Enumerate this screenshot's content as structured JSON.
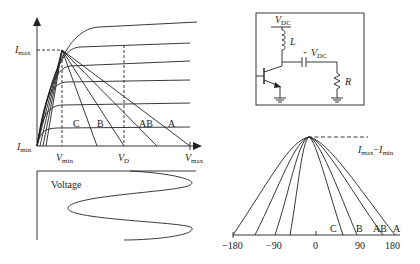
{
  "iv_chart": {
    "y_label_max": "I",
    "y_label_max_sub": "max",
    "y_label_min": "I",
    "y_label_min_sub": "min",
    "x_labels": [
      {
        "main": "V",
        "sub": "min"
      },
      {
        "main": "V",
        "sub": "D"
      },
      {
        "main": "V",
        "sub": "max"
      }
    ],
    "load_lines": [
      "C",
      "B",
      "AB",
      "A"
    ]
  },
  "voltage_plot": {
    "label": "Voltage"
  },
  "circuit": {
    "vdc_top": {
      "main": "V",
      "sub": "DC"
    },
    "inductor": "L",
    "cap_plus": "+",
    "vdc_cap": {
      "main": "V",
      "sub": "DC"
    },
    "resistor": "R"
  },
  "current_pulse": {
    "amplitude_label": {
      "a": "I",
      "a_sub": "max",
      "sep": "−",
      "b": "I",
      "b_sub": "min"
    },
    "class_labels": [
      "C",
      "B",
      "AB",
      "A"
    ],
    "ticks": [
      "−180",
      "−90",
      "0",
      "90",
      "180"
    ]
  },
  "colors": {
    "line": "#222222",
    "background": "#ffffff"
  }
}
